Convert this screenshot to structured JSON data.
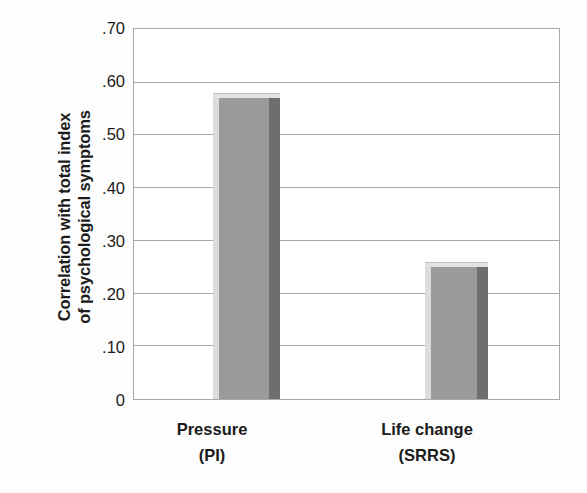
{
  "chart_data": {
    "type": "bar",
    "title": "",
    "subtitle": "",
    "xlabel": "",
    "ylabel": "Correlation with total index of psychological symptoms",
    "ylabel_lines": [
      "Correlation with total index",
      "of psychological symptoms"
    ],
    "categories": [
      "Pressure",
      "Life change"
    ],
    "category_sublabels": [
      "(PI)",
      "(SRRS)"
    ],
    "values": [
      0.58,
      0.26
    ],
    "ylim": [
      0,
      0.7
    ],
    "ytick_values": [
      0.7,
      0.6,
      0.5,
      0.4,
      0.3,
      0.2,
      0.1,
      0
    ],
    "ytick_labels": [
      ".70",
      ".60",
      ".50",
      ".40",
      ".30",
      ".20",
      ".10",
      "0"
    ],
    "grid": true,
    "grid_axis": "y",
    "legend": false,
    "legend_position": "none",
    "series": [
      {
        "name": "Correlation with total index of psychological symptoms",
        "values": [
          0.58,
          0.26
        ]
      }
    ],
    "annotations": []
  },
  "style": {
    "bar_face_color": "#9a9a9a",
    "bar_highlight_color": "#dcdcdc",
    "bar_top_color": "#e3e3e3",
    "bar_shadow_color": "#6e6e6e",
    "gridline_color": "#a9a9a9",
    "axis_color": "#a9a9a9",
    "text_color": "#1b1b1b",
    "background_color": "#ffffff"
  }
}
